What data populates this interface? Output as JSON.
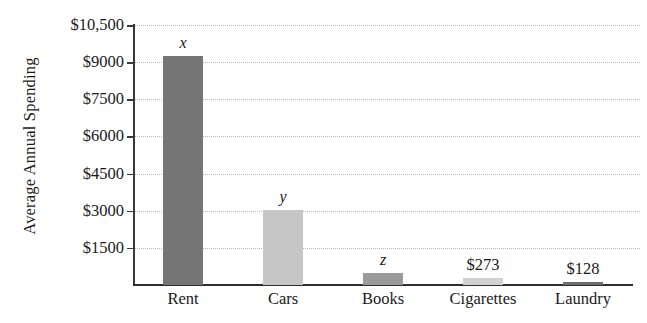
{
  "chart_data": {
    "type": "bar",
    "title": "",
    "xlabel": "",
    "ylabel": "Average Annual Spending",
    "categories": [
      "Rent",
      "Cars",
      "Books",
      "Cigarettes",
      "Laundry"
    ],
    "values": [
      9250,
      3030,
      490,
      273,
      128
    ],
    "data_labels": [
      "x",
      "y",
      "z",
      "$273",
      "$128"
    ],
    "data_label_styles": [
      "italic",
      "italic",
      "italic",
      "normal",
      "normal"
    ],
    "bar_colors": [
      "#757575",
      "#c6c6c6",
      "#9a9a9a",
      "#d2d2d2",
      "#6e6e6e"
    ],
    "ylim": [
      0,
      10500
    ],
    "yticks": [
      1500,
      3000,
      4500,
      6000,
      7500,
      9000,
      10500
    ],
    "ytick_labels": [
      "$1500",
      "$3000",
      "$4500",
      "$6000",
      "$7500",
      "$9000",
      "$10,500"
    ],
    "grid": true,
    "grid_style": "dotted",
    "grid_color": "#b9b9b9",
    "legend": "none",
    "axis_color": "#2e2e2e"
  }
}
